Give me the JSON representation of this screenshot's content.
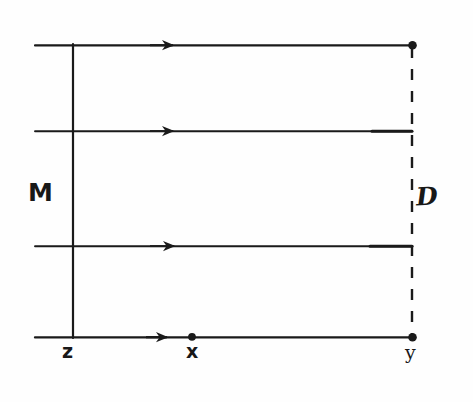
{
  "figure": {
    "kind": "hand-drawn-ray-diagram",
    "background_color": "#fefefe",
    "ink_color": "#1a1a1a",
    "width": 473,
    "height": 402,
    "labels": [
      {
        "id": "M",
        "text": "M",
        "x": 28,
        "y": 180,
        "meaning": "left-vertical-line-label"
      },
      {
        "id": "D",
        "text": "D",
        "x": 416,
        "y": 184,
        "meaning": "right-dashed-line-label"
      },
      {
        "id": "z",
        "text": "z",
        "x": 62,
        "y": 342,
        "meaning": "bottom-left-point-label"
      },
      {
        "id": "x",
        "text": "x",
        "x": 186,
        "y": 342,
        "meaning": "bottom-middle-point-label"
      },
      {
        "id": "y",
        "text": "y",
        "x": 405,
        "y": 343,
        "meaning": "bottom-right-point-label"
      }
    ],
    "horizontal_rays": [
      {
        "index": 1,
        "y": 45,
        "x_start": 35,
        "x_end": 413,
        "arrow_x": 172,
        "end_dot": true
      },
      {
        "index": 2,
        "y": 131,
        "x_start": 35,
        "x_end": 412,
        "arrow_x": 172,
        "end_dot": false
      },
      {
        "index": 3,
        "y": 246,
        "x_start": 35,
        "x_end": 412,
        "arrow_x": 172,
        "end_dot": false
      },
      {
        "index": 4,
        "y": 337,
        "x_start": 35,
        "x_end": 413,
        "arrow_x": 166,
        "end_dot": true
      }
    ],
    "vertical_lines": [
      {
        "id": "M-line",
        "x": 73,
        "y_start": 45,
        "y_end": 337,
        "style": "solid"
      },
      {
        "id": "D-line",
        "x": 412,
        "y_start": 45,
        "y_end": 337,
        "style": "dashed"
      }
    ],
    "points": [
      {
        "id": "x-point",
        "x": 192,
        "y": 337,
        "label": "x"
      },
      {
        "id": "y-point",
        "x": 412,
        "y": 337,
        "label": "y"
      },
      {
        "id": "top-right-point",
        "x": 412,
        "y": 45,
        "label": ""
      }
    ]
  }
}
